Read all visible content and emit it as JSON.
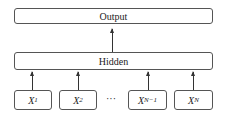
{
  "output": {
    "label": "Output"
  },
  "hidden": {
    "label": "Hidden"
  },
  "inputs": [
    {
      "var": "X",
      "sub": "1"
    },
    {
      "var": "X",
      "sub": "2"
    },
    {
      "var": "X",
      "sub": "N−1"
    },
    {
      "var": "X",
      "sub": "N"
    }
  ],
  "ellipsis": "···"
}
